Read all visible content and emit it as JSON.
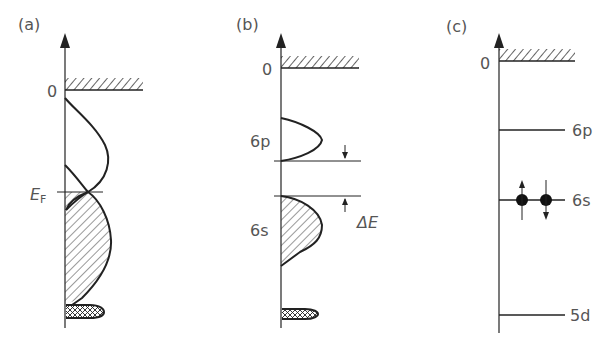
{
  "panels": [
    {
      "id": "a",
      "label": "(a)",
      "zero_label": "0",
      "fermi_label": "E",
      "fermi_sub": "F"
    },
    {
      "id": "b",
      "label": "(b)",
      "zero_label": "0",
      "upper_band": "6p",
      "lower_band": "6s",
      "gap_label": "ΔE"
    },
    {
      "id": "c",
      "label": "(c)",
      "zero_label": "0",
      "levels": [
        "6p",
        "6s",
        "5d"
      ]
    }
  ]
}
